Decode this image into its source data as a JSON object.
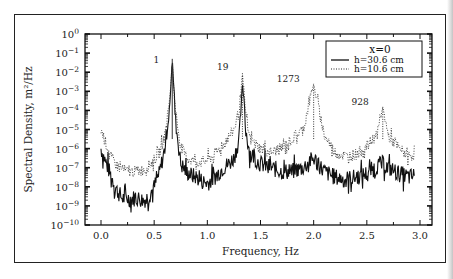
{
  "chart_data": {
    "type": "line",
    "title": "",
    "xlabel": "Frequency, Hz",
    "ylabel": "Spectral Density, m²/Hz",
    "xlim": [
      -0.15,
      3.12
    ],
    "ylim_log10": [
      -10,
      0
    ],
    "x_ticks": [
      "0.0",
      "0.5",
      "1.0",
      "1.5",
      "2.0",
      "2.5",
      "3.0"
    ],
    "x_tick_values": [
      0.0,
      0.5,
      1.0,
      1.5,
      2.0,
      2.5,
      3.0
    ],
    "y_ticks": [
      "10^0",
      "10^-1",
      "10^-2",
      "10^-3",
      "10^-4",
      "10^-5",
      "10^-6",
      "10^-7",
      "10^-8",
      "10^-9",
      "10^-10"
    ],
    "y_scale": "log",
    "grid": false,
    "legend": {
      "position": "upper-right",
      "title": "x=0",
      "entries": [
        {
          "label": "h=30.6 cm",
          "style": "solid"
        },
        {
          "label": "h=10.6 cm",
          "style": "dotted"
        }
      ]
    },
    "annotations": [
      {
        "text": "1",
        "x": 0.67,
        "log10_y": -1.3
      },
      {
        "text": "19",
        "x": 1.33,
        "log10_y": -2.0
      },
      {
        "text": "1273",
        "x": 2.0,
        "log10_y": -2.6
      },
      {
        "text": "928",
        "x": 2.65,
        "log10_y": -3.8
      }
    ],
    "series": [
      {
        "name": "h=30.6 cm",
        "style": "solid",
        "x": [
          0.0,
          0.05,
          0.1,
          0.15,
          0.2,
          0.25,
          0.3,
          0.35,
          0.4,
          0.45,
          0.5,
          0.55,
          0.6,
          0.65,
          0.67,
          0.7,
          0.75,
          0.8,
          0.85,
          0.9,
          0.95,
          1.0,
          1.05,
          1.1,
          1.15,
          1.2,
          1.25,
          1.3,
          1.33,
          1.36,
          1.4,
          1.5,
          1.6,
          1.7,
          1.8,
          1.9,
          2.0,
          2.1,
          2.2,
          2.3,
          2.4,
          2.5,
          2.6,
          2.65,
          2.7,
          2.8,
          2.9,
          2.95
        ],
        "log10_y": [
          -6.0,
          -6.8,
          -7.5,
          -8.2,
          -8.6,
          -8.6,
          -8.6,
          -8.6,
          -8.7,
          -8.5,
          -8.0,
          -7.3,
          -6.0,
          -3.5,
          -1.3,
          -4.5,
          -6.8,
          -7.2,
          -7.4,
          -7.5,
          -7.7,
          -7.8,
          -7.6,
          -7.3,
          -7.0,
          -6.8,
          -6.5,
          -5.5,
          -2.5,
          -5.0,
          -6.2,
          -6.8,
          -7.0,
          -7.2,
          -7.2,
          -7.0,
          -6.5,
          -7.2,
          -7.5,
          -7.6,
          -7.5,
          -7.3,
          -6.9,
          -6.8,
          -7.0,
          -7.3,
          -7.5,
          -7.4
        ]
      },
      {
        "name": "h=10.6 cm",
        "style": "dotted",
        "x": [
          0.0,
          0.05,
          0.1,
          0.15,
          0.2,
          0.25,
          0.3,
          0.35,
          0.4,
          0.45,
          0.5,
          0.55,
          0.6,
          0.65,
          0.67,
          0.7,
          0.75,
          0.8,
          0.85,
          0.9,
          0.95,
          1.0,
          1.05,
          1.1,
          1.15,
          1.2,
          1.25,
          1.3,
          1.33,
          1.36,
          1.4,
          1.5,
          1.6,
          1.7,
          1.8,
          1.9,
          2.0,
          2.1,
          2.2,
          2.3,
          2.4,
          2.5,
          2.6,
          2.65,
          2.7,
          2.8,
          2.9,
          2.95
        ],
        "log10_y": [
          -5.0,
          -5.8,
          -6.5,
          -6.9,
          -7.1,
          -7.2,
          -7.2,
          -7.2,
          -7.1,
          -6.9,
          -6.6,
          -6.2,
          -5.3,
          -3.2,
          -1.5,
          -4.0,
          -5.9,
          -6.4,
          -6.6,
          -6.7,
          -6.7,
          -6.6,
          -6.4,
          -6.1,
          -5.8,
          -5.4,
          -5.0,
          -4.0,
          -2.0,
          -4.3,
          -5.5,
          -6.0,
          -6.2,
          -6.0,
          -5.5,
          -5.0,
          -2.6,
          -5.3,
          -6.2,
          -6.4,
          -6.3,
          -5.9,
          -5.2,
          -3.8,
          -5.3,
          -6.0,
          -6.4,
          -6.3
        ]
      }
    ]
  }
}
